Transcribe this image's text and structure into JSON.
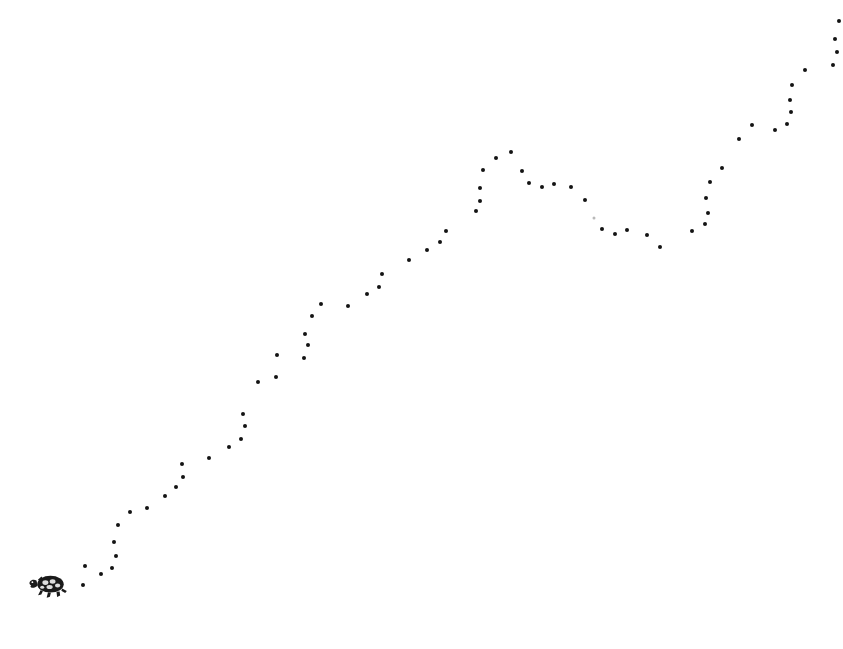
{
  "figure": {
    "background_color": "#ffffff",
    "point_color": "#131313",
    "width": 843,
    "height": 649,
    "marker_icon": "turtle-icon",
    "marker_label": "turtle"
  },
  "chart_data": {
    "type": "scatter",
    "title": "",
    "subtitle": "",
    "xlabel": "",
    "ylabel": "",
    "grid": false,
    "legend": null,
    "axis_visible": false,
    "tick_labels": [],
    "annotations": [
      {
        "name": "turtle-icon",
        "description": "small black turtle illustration at the start of the dot trail",
        "x": 48,
        "y": 585
      }
    ],
    "xlim": [
      0,
      843
    ],
    "ylim": [
      649,
      0
    ],
    "point_radius_px": 2,
    "points": [
      {
        "x": 83,
        "y": 585
      },
      {
        "x": 85,
        "y": 566
      },
      {
        "x": 101,
        "y": 574
      },
      {
        "x": 112,
        "y": 568
      },
      {
        "x": 116,
        "y": 556
      },
      {
        "x": 114,
        "y": 542
      },
      {
        "x": 118,
        "y": 525
      },
      {
        "x": 130,
        "y": 512
      },
      {
        "x": 147,
        "y": 508
      },
      {
        "x": 165,
        "y": 496
      },
      {
        "x": 176,
        "y": 487
      },
      {
        "x": 183,
        "y": 477
      },
      {
        "x": 182,
        "y": 464
      },
      {
        "x": 209,
        "y": 458
      },
      {
        "x": 229,
        "y": 447
      },
      {
        "x": 241,
        "y": 439
      },
      {
        "x": 245,
        "y": 426
      },
      {
        "x": 243,
        "y": 414
      },
      {
        "x": 258,
        "y": 382
      },
      {
        "x": 276,
        "y": 377
      },
      {
        "x": 277,
        "y": 355
      },
      {
        "x": 304,
        "y": 358
      },
      {
        "x": 308,
        "y": 345
      },
      {
        "x": 305,
        "y": 334
      },
      {
        "x": 312,
        "y": 316
      },
      {
        "x": 321,
        "y": 304
      },
      {
        "x": 348,
        "y": 306
      },
      {
        "x": 367,
        "y": 294
      },
      {
        "x": 379,
        "y": 287
      },
      {
        "x": 382,
        "y": 274
      },
      {
        "x": 409,
        "y": 260
      },
      {
        "x": 427,
        "y": 250
      },
      {
        "x": 440,
        "y": 242
      },
      {
        "x": 446,
        "y": 231
      },
      {
        "x": 476,
        "y": 211
      },
      {
        "x": 480,
        "y": 201
      },
      {
        "x": 480,
        "y": 188
      },
      {
        "x": 483,
        "y": 170
      },
      {
        "x": 496,
        "y": 158
      },
      {
        "x": 511,
        "y": 152
      },
      {
        "x": 522,
        "y": 171
      },
      {
        "x": 529,
        "y": 183
      },
      {
        "x": 542,
        "y": 187
      },
      {
        "x": 554,
        "y": 184
      },
      {
        "x": 571,
        "y": 187
      },
      {
        "x": 585,
        "y": 200
      },
      {
        "x": 594,
        "y": 218,
        "faint": true
      },
      {
        "x": 602,
        "y": 229
      },
      {
        "x": 615,
        "y": 234
      },
      {
        "x": 627,
        "y": 230
      },
      {
        "x": 647,
        "y": 235
      },
      {
        "x": 660,
        "y": 247
      },
      {
        "x": 692,
        "y": 231
      },
      {
        "x": 705,
        "y": 224
      },
      {
        "x": 708,
        "y": 213
      },
      {
        "x": 706,
        "y": 198
      },
      {
        "x": 710,
        "y": 182
      },
      {
        "x": 722,
        "y": 168
      },
      {
        "x": 739,
        "y": 139
      },
      {
        "x": 752,
        "y": 125
      },
      {
        "x": 775,
        "y": 130
      },
      {
        "x": 787,
        "y": 124
      },
      {
        "x": 791,
        "y": 112
      },
      {
        "x": 790,
        "y": 100
      },
      {
        "x": 792,
        "y": 85
      },
      {
        "x": 805,
        "y": 70
      },
      {
        "x": 833,
        "y": 65
      },
      {
        "x": 837,
        "y": 52
      },
      {
        "x": 835,
        "y": 39
      },
      {
        "x": 839,
        "y": 21
      }
    ]
  }
}
